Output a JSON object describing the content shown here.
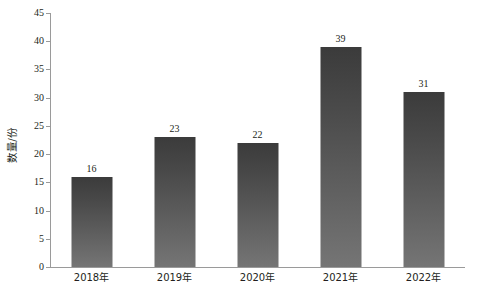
{
  "chart_data": {
    "type": "bar",
    "title": "",
    "subtitle": "",
    "xlabel": "",
    "ylabel": "数量/份",
    "categories": [
      "2018年",
      "2019年",
      "2020年",
      "2021年",
      "2022年"
    ],
    "values": [
      16,
      23,
      22,
      39,
      31
    ],
    "series": [
      {
        "name": "数量/份",
        "values": [
          16,
          23,
          22,
          39,
          31
        ]
      }
    ],
    "ylim": [
      0,
      45
    ],
    "ytick_step": 5,
    "yticks": [
      0,
      5,
      10,
      15,
      20,
      25,
      30,
      35,
      40,
      45
    ],
    "ytick_labels": [
      "0",
      "5",
      "10",
      "15",
      "20",
      "25",
      "30",
      "35",
      "40",
      "45"
    ],
    "data_labels": [
      "16",
      "23",
      "22",
      "39",
      "31"
    ],
    "grid": false,
    "legend": false,
    "legend_position": "none",
    "bar_gradient_top": "#3b3b3b",
    "bar_gradient_bottom": "#757575",
    "axis_color": "#9a9a9a",
    "text_color": "#231f20",
    "background": "#ffffff"
  }
}
